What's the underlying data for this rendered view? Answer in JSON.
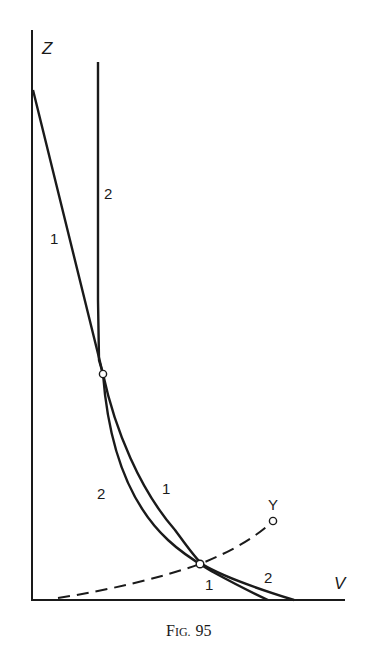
{
  "figure": {
    "caption": "Fig. 95",
    "caption_prefix_large": "F",
    "caption_prefix_small": "IG.",
    "caption_number": "95"
  },
  "axes": {
    "vertical_label": "Z",
    "horizontal_label": "V"
  },
  "curves": [
    {
      "id": "curve-1",
      "labels": [
        "1",
        "1",
        "1"
      ]
    },
    {
      "id": "curve-2",
      "labels": [
        "2",
        "2",
        "2"
      ]
    }
  ],
  "dashed_curve": {
    "end_label": "Y"
  },
  "colors": {
    "ink": "#1a1a1a",
    "background": "#ffffff"
  }
}
